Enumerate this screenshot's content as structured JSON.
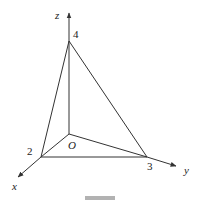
{
  "diagram": {
    "type": "3d-coordinate-tetrahedron",
    "axes": {
      "x": {
        "label": "x"
      },
      "y": {
        "label": "y"
      },
      "z": {
        "label": "z"
      }
    },
    "origin": {
      "label": "O"
    },
    "intercepts": {
      "x": {
        "label": "2",
        "value": 2
      },
      "y": {
        "label": "3",
        "value": 3
      },
      "z": {
        "label": "4",
        "value": 4
      }
    },
    "edges": [
      [
        "O",
        "X2"
      ],
      [
        "O",
        "Y3"
      ],
      [
        "O",
        "Z4"
      ],
      [
        "X2",
        "Y3"
      ],
      [
        "X2",
        "Z4"
      ],
      [
        "Y3",
        "Z4"
      ]
    ],
    "colors": {
      "line": "#333333",
      "text": "#222222",
      "background": "#ffffff"
    }
  }
}
